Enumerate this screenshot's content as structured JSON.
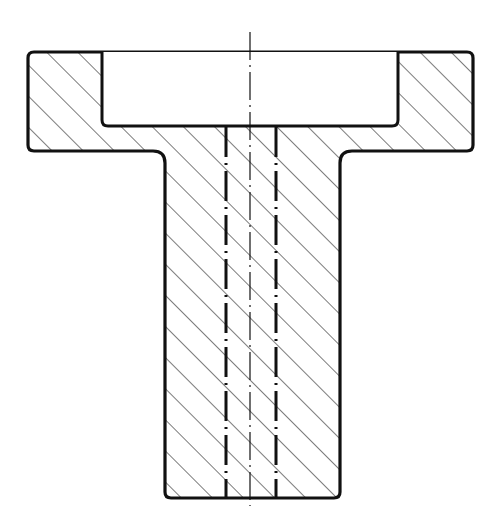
{
  "drawing": {
    "type": "technical-cross-section",
    "subject": "flanged bushing with counterbore and through bore",
    "colors": {
      "line": "#111111",
      "background": "#ffffff",
      "hatch": "#222222"
    },
    "hatch": {
      "angle_deg": 45,
      "spacing_px": 22
    },
    "geometry": {
      "flange": {
        "x1": 28,
        "x2": 473,
        "y1": 52,
        "y2": 151
      },
      "recess": {
        "x1": 102,
        "x2": 398,
        "y1": 52,
        "y2": 126
      },
      "stem": {
        "x1": 165,
        "x2": 340,
        "y2": 498
      },
      "bore": {
        "x1": 226,
        "x2": 276
      },
      "centerline": {
        "x": 250,
        "y1": 32,
        "y2": 506
      }
    }
  }
}
